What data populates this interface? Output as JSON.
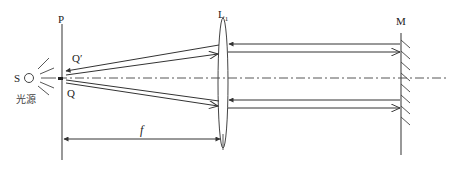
{
  "diagram": {
    "type": "optical-schematic",
    "colors": {
      "stroke": "#333333",
      "background": "#ffffff"
    },
    "labels": {
      "source": "S",
      "source_cn": "光源",
      "plane": "P",
      "point_upper": "Q′",
      "point_lower": "Q",
      "lens": "L",
      "lens_sub": "1",
      "mirror": "M",
      "focal_length": "f"
    },
    "components": [
      {
        "id": "source",
        "label": "S",
        "caption": "光源"
      },
      {
        "id": "focal-plane",
        "label": "P"
      },
      {
        "id": "lens",
        "label": "L1"
      },
      {
        "id": "mirror",
        "label": "M"
      }
    ],
    "dimension": {
      "label": "f",
      "from": "focal-plane",
      "to": "lens"
    }
  }
}
